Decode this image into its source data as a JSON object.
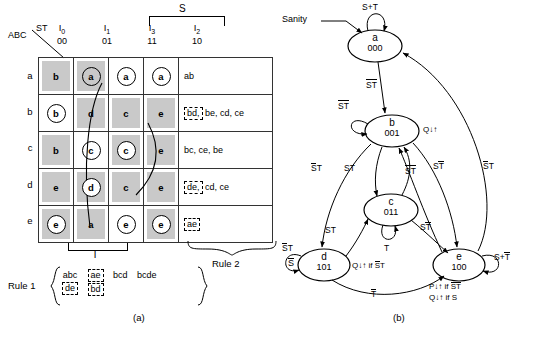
{
  "figure": {
    "subcaption_a": "(a)",
    "subcaption_b": "(b)"
  },
  "flow_table": {
    "corner_row_label": "ABC",
    "corner_col_label": "ST",
    "group_bracket_label": "S",
    "columns": [
      {
        "name": "I",
        "sub": "0",
        "bits": "00"
      },
      {
        "name": "I",
        "sub": "1",
        "bits": "01"
      },
      {
        "name": "I",
        "sub": "3",
        "bits": "11"
      },
      {
        "name": "I",
        "sub": "2",
        "bits": "10"
      }
    ],
    "row_labels": [
      "a",
      "b",
      "c",
      "d",
      "e"
    ],
    "rows": [
      {
        "label": "a",
        "cells": [
          {
            "value": "b",
            "circled": false,
            "shaded": true
          },
          {
            "value": "a",
            "circled": true,
            "shaded": true
          },
          {
            "value": "a",
            "circled": true,
            "shaded": false
          },
          {
            "value": "a",
            "circled": true,
            "shaded": false
          }
        ],
        "rule2_dashed": "",
        "rule2_rest": "ab"
      },
      {
        "label": "b",
        "cells": [
          {
            "value": "b",
            "circled": true,
            "shaded": false
          },
          {
            "value": "d",
            "circled": false,
            "shaded": true
          },
          {
            "value": "c",
            "circled": false,
            "shaded": true
          },
          {
            "value": "e",
            "circled": false,
            "shaded": true
          }
        ],
        "rule2_dashed": "bd,",
        "rule2_rest": "be, cd, ce"
      },
      {
        "label": "c",
        "cells": [
          {
            "value": "b",
            "circled": false,
            "shaded": true
          },
          {
            "value": "c",
            "circled": true,
            "shaded": false
          },
          {
            "value": "c",
            "circled": true,
            "shaded": true
          },
          {
            "value": "e",
            "circled": false,
            "shaded": true
          }
        ],
        "rule2_dashed": "",
        "rule2_rest": "bc, ce, be"
      },
      {
        "label": "d",
        "cells": [
          {
            "value": "e",
            "circled": false,
            "shaded": true
          },
          {
            "value": "d",
            "circled": true,
            "shaded": true
          },
          {
            "value": "c",
            "circled": false,
            "shaded": true
          },
          {
            "value": "e",
            "circled": false,
            "shaded": true
          }
        ],
        "rule2_dashed": "de,",
        "rule2_rest": "cd, ce"
      },
      {
        "label": "e",
        "cells": [
          {
            "value": "e",
            "circled": true,
            "shaded": true
          },
          {
            "value": "a",
            "circled": false,
            "shaded": true
          },
          {
            "value": "e",
            "circled": true,
            "shaded": false
          },
          {
            "value": "e",
            "circled": true,
            "shaded": true
          }
        ],
        "rule2_dashed": "ae",
        "rule2_rest": ""
      }
    ],
    "t_bracket_label": "T",
    "rule2_label": "Rule 2",
    "s_bar_right": "S",
    "rule1": {
      "label": "Rule 1",
      "groups": [
        {
          "top": "abc",
          "bottom": "de",
          "top_dashed": false,
          "bottom_dashed": true
        },
        {
          "top": "ae",
          "bottom": "bd",
          "top_dashed": true,
          "bottom_dashed": true
        },
        {
          "top": "bcd",
          "bottom": "",
          "top_dashed": false,
          "bottom_dashed": false
        },
        {
          "top": "bcde",
          "bottom": "",
          "top_dashed": false,
          "bottom_dashed": false
        }
      ]
    }
  },
  "state_diagram": {
    "sanity_label": "Sanity",
    "nodes": [
      {
        "id": "a",
        "name": "a",
        "code": "000"
      },
      {
        "id": "b",
        "name": "b",
        "code": "001"
      },
      {
        "id": "c",
        "name": "c",
        "code": "011"
      },
      {
        "id": "d",
        "name": "d",
        "code": "101"
      },
      {
        "id": "e",
        "name": "e",
        "code": "100"
      }
    ],
    "self_loops": [
      {
        "node": "a",
        "label": "S+T"
      },
      {
        "node": "b",
        "label": "ST",
        "bars": "both"
      },
      {
        "node": "c",
        "label": "T"
      },
      {
        "node": "d",
        "label": "ST",
        "bars": "first"
      },
      {
        "node": "e",
        "label": "S+T",
        "bars": "second"
      }
    ],
    "edges": [
      {
        "from": "a",
        "to": "b",
        "label": "ST",
        "bars": "both"
      },
      {
        "from": "b",
        "to": "d",
        "label": "ST",
        "bars": "first"
      },
      {
        "from": "b",
        "to": "c",
        "label": "ST",
        "bars": "none"
      },
      {
        "from": "c",
        "to": "b",
        "label": "ST",
        "bars": "both"
      },
      {
        "from": "b",
        "to": "e",
        "label": "ST",
        "bars": "second"
      },
      {
        "from": "e",
        "to": "a",
        "label": "ST",
        "bars": "first"
      },
      {
        "from": "d",
        "to": "c",
        "label": "ST",
        "bars": "none"
      },
      {
        "from": "c",
        "to": "e",
        "label": "ST",
        "bars": "second"
      },
      {
        "from": "d",
        "to": "e",
        "label": "T",
        "bars": "first"
      }
    ],
    "outputs": [
      {
        "node": "b",
        "text": "Q↓↑"
      },
      {
        "node": "d",
        "text": "Q↓↑ if ST",
        "bars": "first"
      },
      {
        "node": "e",
        "line1": "P↓↑ if ST",
        "line2": "Q↓↑ if S"
      }
    ]
  }
}
